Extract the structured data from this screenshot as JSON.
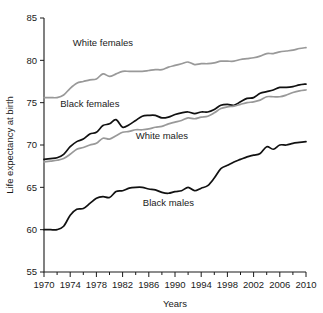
{
  "chart_data": {
    "type": "line",
    "title": "",
    "xlabel": "Years",
    "ylabel": "Life expectancy at birth",
    "xlim": [
      1970,
      2010
    ],
    "ylim": [
      55,
      85
    ],
    "grid": false,
    "legend_position": "inline-annotations",
    "xticks": [
      1970,
      1974,
      1978,
      1982,
      1986,
      1990,
      1994,
      1998,
      2002,
      2006,
      2010
    ],
    "xtick_labels": [
      "1970",
      "1974",
      "1978",
      "1982",
      "1986",
      "1990",
      "1994",
      "1998",
      "2002",
      "2006",
      "2010"
    ],
    "xminor_ticks": [
      1972,
      1976,
      1980,
      1984,
      1988,
      1992,
      1996,
      2000,
      2004,
      2008
    ],
    "yticks": [
      55,
      60,
      65,
      70,
      75,
      80,
      85
    ],
    "ytick_labels": [
      "55",
      "60",
      "65",
      "70",
      "75",
      "80",
      "85"
    ],
    "x": [
      1970,
      1971,
      1972,
      1973,
      1974,
      1975,
      1976,
      1977,
      1978,
      1979,
      1980,
      1981,
      1982,
      1983,
      1984,
      1985,
      1986,
      1987,
      1988,
      1989,
      1990,
      1991,
      1992,
      1993,
      1994,
      1995,
      1996,
      1997,
      1998,
      1999,
      2000,
      2001,
      2002,
      2003,
      2004,
      2005,
      2006,
      2007,
      2008,
      2009,
      2010
    ],
    "series": [
      {
        "name": "White females",
        "color": "#999999",
        "label_x": 1979,
        "label_y": 82.1,
        "values": [
          75.6,
          75.6,
          75.6,
          75.9,
          76.7,
          77.3,
          77.5,
          77.7,
          77.8,
          78.4,
          78.1,
          78.4,
          78.7,
          78.7,
          78.7,
          78.7,
          78.8,
          78.9,
          78.9,
          79.2,
          79.4,
          79.6,
          79.8,
          79.5,
          79.6,
          79.6,
          79.7,
          79.9,
          79.9,
          79.9,
          80.1,
          80.2,
          80.3,
          80.5,
          80.8,
          80.8,
          81.0,
          81.1,
          81.2,
          81.4,
          81.5
        ]
      },
      {
        "name": "Black females",
        "color": "#111111",
        "label_x": 1977,
        "label_y": 74.9,
        "values": [
          68.3,
          68.4,
          68.5,
          68.9,
          69.8,
          70.4,
          70.7,
          71.3,
          71.5,
          72.3,
          72.5,
          73.0,
          72.1,
          72.4,
          72.9,
          73.4,
          73.5,
          73.5,
          73.2,
          73.3,
          73.6,
          73.8,
          73.9,
          73.7,
          73.9,
          73.9,
          74.2,
          74.7,
          74.8,
          74.7,
          75.1,
          75.5,
          75.6,
          76.1,
          76.3,
          76.5,
          76.8,
          76.8,
          76.9,
          77.1,
          77.2
        ]
      },
      {
        "name": "White males",
        "color": "#999999",
        "label_x": 1988,
        "label_y": 71.1,
        "values": [
          68.0,
          68.1,
          68.2,
          68.4,
          68.9,
          69.5,
          69.7,
          70.0,
          70.2,
          70.8,
          70.7,
          71.1,
          71.5,
          71.6,
          71.8,
          71.8,
          71.9,
          72.1,
          72.2,
          72.5,
          72.7,
          72.9,
          73.2,
          73.1,
          73.3,
          73.4,
          73.8,
          74.3,
          74.5,
          74.6,
          74.8,
          75.0,
          75.1,
          75.3,
          75.7,
          75.7,
          75.7,
          75.9,
          76.2,
          76.4,
          76.5
        ]
      },
      {
        "name": "Black males",
        "color": "#111111",
        "label_x": 1989,
        "label_y": 63.2,
        "values": [
          60.0,
          60.0,
          60.0,
          60.4,
          61.7,
          62.4,
          62.5,
          63.1,
          63.7,
          63.9,
          63.8,
          64.5,
          64.6,
          64.9,
          65.0,
          65.0,
          64.8,
          64.7,
          64.4,
          64.3,
          64.5,
          64.6,
          65.0,
          64.6,
          64.9,
          65.2,
          66.1,
          67.2,
          67.6,
          68.0,
          68.3,
          68.6,
          68.8,
          69.0,
          69.8,
          69.5,
          70.0,
          70.0,
          70.2,
          70.3,
          70.4
        ]
      }
    ]
  },
  "plot": {
    "left": 44,
    "right": 306,
    "top": 18,
    "bottom": 272
  }
}
